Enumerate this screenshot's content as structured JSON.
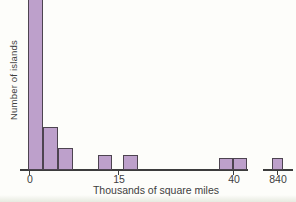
{
  "figure": {
    "ylabel": "Number of islands",
    "xlabel": "Thousands of square miles"
  },
  "colors": {
    "background": "#fdfdfa",
    "bar_fill": "#bda0cb",
    "bar_border": "#4d4450",
    "axis": "#3c3c3c",
    "text": "#3e3e3e",
    "scan_tint": "#e7eae0"
  },
  "chart_data": {
    "type": "bar",
    "subtype": "histogram",
    "title": "",
    "xlabel": "Thousands of square miles",
    "ylabel": "Number of islands",
    "x_tick_labels": [
      "0",
      "15",
      "40",
      "840"
    ],
    "y_axis_tick_labels_visible": false,
    "axis_break_between": [
      "40",
      "840"
    ],
    "note": "Strongly right-skewed histogram of island sizes; tallest bar at 0 is clipped by the top edge of the screenshot; x axis has a break before the 840 outlier bar.",
    "bars": [
      {
        "bin": "first bin at 0",
        "count": 13,
        "clipped_top": true,
        "px": {
          "x": 28,
          "w": 15,
          "h": 176
        }
      },
      {
        "bin": "second bin",
        "count": 3,
        "px": {
          "x": 43,
          "w": 15,
          "h": 43
        }
      },
      {
        "bin": "third bin",
        "count": 2,
        "px": {
          "x": 58,
          "w": 15,
          "h": 22
        }
      },
      {
        "bin": "just left of 15",
        "count": 1,
        "px": {
          "x": 98,
          "w": 14,
          "h": 15
        }
      },
      {
        "bin": "just right of 15",
        "count": 1,
        "px": {
          "x": 123,
          "w": 15,
          "h": 15
        }
      },
      {
        "bin": "left of 40",
        "count": 1,
        "px": {
          "x": 219,
          "w": 14,
          "h": 12
        }
      },
      {
        "bin": "right of 40",
        "count": 1,
        "px": {
          "x": 233,
          "w": 14,
          "h": 12
        }
      },
      {
        "bin": "at 840 after break",
        "count": 1,
        "px": {
          "x": 272,
          "w": 11,
          "h": 12
        }
      }
    ],
    "axis_segments_px": [
      {
        "x1": 20,
        "x2": 248
      },
      {
        "x1": 263,
        "x2": 293
      }
    ],
    "ticks_px": [
      {
        "label": "0",
        "x": 29
      },
      {
        "label": "15",
        "x": 118
      },
      {
        "label": "40",
        "x": 233
      },
      {
        "label": "840",
        "x": 277
      }
    ],
    "baseline_y_px": 170
  }
}
